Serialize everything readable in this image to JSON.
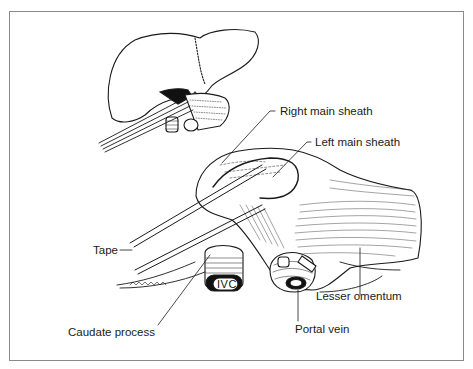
{
  "figure": {
    "labels": {
      "right_main_sheath": "Right main sheath",
      "left_main_sheath": "Left main sheath",
      "tape": "Tape",
      "ivc": "IVC",
      "caudate_process": "Caudate process",
      "portal_vein": "Portal vein",
      "lesser_omentum": "Lesser omentum"
    },
    "colors": {
      "line": "#1a1a1a",
      "frame": "#8a8a8a",
      "background": "#ffffff"
    }
  }
}
